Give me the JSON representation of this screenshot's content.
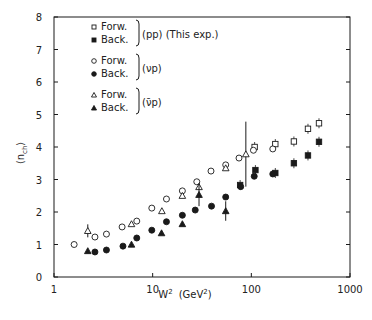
{
  "chart_data": {
    "type": "scatter",
    "title": "",
    "xlabel": "W² (GeV²)",
    "ylabel": "⟨n_ch⟩",
    "xscale": "log",
    "xlim": [
      1,
      1000
    ],
    "ylim": [
      0,
      8
    ],
    "x_ticks": [
      1,
      10,
      100,
      1000
    ],
    "x_tick_labels": [
      "1",
      "10",
      "100",
      "1000"
    ],
    "y_ticks": [
      0,
      1,
      2,
      3,
      4,
      5,
      6,
      7,
      8
    ],
    "y_tick_labels": [
      "0",
      "1",
      "2",
      "3",
      "4",
      "5",
      "6",
      "7",
      "8"
    ],
    "grid": false,
    "legend_position": "upper-left",
    "legend_groups": [
      {
        "group_label": "(pp) (This exp.)",
        "entries": [
          {
            "marker": "open-square",
            "label": "Forw."
          },
          {
            "marker": "filled-square",
            "label": "Back."
          }
        ]
      },
      {
        "group_label": "(νp)",
        "entries": [
          {
            "marker": "open-circle",
            "label": "Forw."
          },
          {
            "marker": "filled-circle",
            "label": "Back."
          }
        ]
      },
      {
        "group_label": "(ν̄p)",
        "entries": [
          {
            "marker": "open-triangle",
            "label": "Forw."
          },
          {
            "marker": "filled-triangle",
            "label": "Back."
          }
        ]
      }
    ],
    "series": [
      {
        "name": "pp Forw. (This exp.)",
        "marker": "open-square",
        "points": [
          [
            108,
            4.0
          ],
          [
            175,
            4.09
          ],
          [
            270,
            4.17
          ],
          [
            375,
            4.56
          ],
          [
            485,
            4.73
          ]
        ]
      },
      {
        "name": "pp Back. (This exp.)",
        "marker": "filled-square",
        "points": [
          [
            77,
            2.83
          ],
          [
            110,
            3.29
          ],
          [
            175,
            3.2
          ],
          [
            270,
            3.5
          ],
          [
            375,
            3.74
          ],
          [
            485,
            4.16
          ]
        ]
      },
      {
        "name": "νp Forw.",
        "marker": "open-circle",
        "points": [
          [
            1.6,
            1.0
          ],
          [
            2.6,
            1.23
          ],
          [
            3.4,
            1.32
          ],
          [
            4.9,
            1.54
          ],
          [
            6.9,
            1.72
          ],
          [
            9.8,
            2.12
          ],
          [
            13.8,
            2.4
          ],
          [
            20,
            2.65
          ],
          [
            28,
            2.93
          ],
          [
            39,
            3.26
          ],
          [
            55,
            3.45
          ],
          [
            75,
            3.66
          ],
          [
            105,
            3.9
          ],
          [
            165,
            3.94
          ]
        ]
      },
      {
        "name": "νp Back.",
        "marker": "filled-circle",
        "points": [
          [
            2.6,
            0.77
          ],
          [
            3.4,
            0.83
          ],
          [
            5.0,
            0.95
          ],
          [
            6.9,
            1.2
          ],
          [
            9.8,
            1.44
          ],
          [
            13.8,
            1.7
          ],
          [
            20,
            1.9
          ],
          [
            27,
            2.06
          ],
          [
            39.5,
            2.18
          ],
          [
            55,
            2.46
          ],
          [
            78,
            2.78
          ],
          [
            107,
            3.1
          ],
          [
            165,
            3.17
          ]
        ]
      },
      {
        "name": "ν̄p Forw.",
        "marker": "open-triangle",
        "points": [
          [
            2.2,
            1.42,
            0.2
          ],
          [
            6.1,
            1.63
          ],
          [
            12.4,
            2.03
          ],
          [
            20,
            2.5
          ],
          [
            29.5,
            2.77
          ],
          [
            55,
            3.35
          ],
          [
            88,
            3.78,
            1.0
          ]
        ]
      },
      {
        "name": "ν̄p Back.",
        "marker": "filled-triangle",
        "points": [
          [
            2.2,
            0.8
          ],
          [
            6.1,
            1.0
          ],
          [
            12.3,
            1.35
          ],
          [
            20,
            1.63
          ],
          [
            29.5,
            2.53,
            0.35
          ],
          [
            55,
            2.03,
            0.3
          ]
        ]
      }
    ]
  },
  "labels": {
    "xlabel_main": "W",
    "xlabel_sup": "2",
    "xlabel_unit_open": "(GeV",
    "xlabel_unit_sup": "2",
    "xlabel_unit_close": ")",
    "ylabel_open": "⟨n",
    "ylabel_sub": "ch",
    "ylabel_close": "⟩"
  }
}
